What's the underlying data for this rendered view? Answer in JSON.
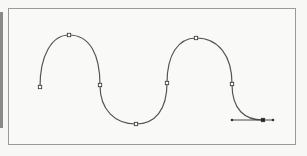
{
  "figure": {
    "type": "bezier-path-illustration",
    "colors": {
      "background": "#f7f7f6",
      "frame_border": "#9a9a9a",
      "side_bar": "#8a8a8a",
      "path_stroke": "#555555",
      "anchor_stroke": "#333333",
      "anchor_fill": "#ffffff",
      "selected_anchor_fill": "#222222",
      "handle_line": "#333333"
    },
    "path": {
      "d": "M40,87 C40,55 52,35 69,35 C90,35 100,55 100,85 C100,110 115,124 136,124 C155,124 167,110 167,83 C167,55 178,38 196,38 C218,38 232,55 232,84 C232,110 245,120 263,120",
      "anchors": [
        {
          "x": 40,
          "y": 87,
          "selected": false
        },
        {
          "x": 69,
          "y": 35,
          "selected": false
        },
        {
          "x": 100,
          "y": 85,
          "selected": false
        },
        {
          "x": 136,
          "y": 124,
          "selected": false
        },
        {
          "x": 167,
          "y": 83,
          "selected": false
        },
        {
          "x": 196,
          "y": 38,
          "selected": false
        },
        {
          "x": 232,
          "y": 84,
          "selected": false
        },
        {
          "x": 263,
          "y": 120,
          "selected": true
        }
      ],
      "direction_handles": {
        "anchor_index": 7,
        "in": {
          "x": 232,
          "y": 120
        },
        "out": {
          "x": 273,
          "y": 120
        }
      }
    }
  }
}
